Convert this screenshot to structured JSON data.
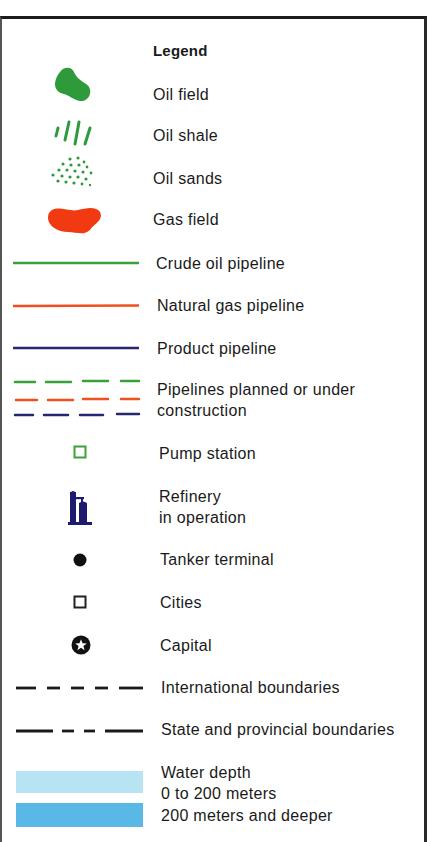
{
  "legend": {
    "title": "Legend",
    "items": [
      {
        "label": "Oil field",
        "icon": "oil-field-blob",
        "color": "#2e9a3a"
      },
      {
        "label": "Oil shale",
        "icon": "oil-shale-hatch",
        "color": "#2e9a3a"
      },
      {
        "label": "Oil sands",
        "icon": "oil-sands-dots",
        "color": "#2e9a3a"
      },
      {
        "label": "Gas field",
        "icon": "gas-field-blob",
        "color": "#f23a12"
      },
      {
        "label": "Crude oil pipeline",
        "icon": "solid-line",
        "color": "#3aa13a"
      },
      {
        "label": "Natural gas pipeline",
        "icon": "solid-line",
        "color": "#f0501e"
      },
      {
        "label": "Product pipeline",
        "icon": "solid-line",
        "color": "#28266e"
      },
      {
        "label_line1": "Pipelines planned or under",
        "label_line2": "construction",
        "icon": "dashed-lines",
        "colors": [
          "#3aa13a",
          "#f0501e",
          "#28266e"
        ]
      },
      {
        "label": "Pump station",
        "icon": "hollow-square",
        "color": "#3aa13a"
      },
      {
        "label_line1": "Refinery",
        "label_line2": "in operation",
        "icon": "refinery",
        "color": "#1e1a6e"
      },
      {
        "label": "Tanker terminal",
        "icon": "filled-circle",
        "color": "#111111"
      },
      {
        "label": "Cities",
        "icon": "hollow-square",
        "color": "#222222"
      },
      {
        "label": "Capital",
        "icon": "circle-star",
        "color": "#111111"
      },
      {
        "label": "International boundaries",
        "icon": "dash-line",
        "color": "#1a1a1a"
      },
      {
        "label": "State and provincial boundaries",
        "icon": "long-short-dash-line",
        "color": "#1a1a1a"
      },
      {
        "label_line1": "Water depth",
        "label_line2": "0 to 200 meters",
        "icon": "swatch",
        "color": "#b7e3f2"
      },
      {
        "label": "200 meters and deeper",
        "icon": "swatch",
        "color": "#5ab8e6"
      }
    ]
  }
}
